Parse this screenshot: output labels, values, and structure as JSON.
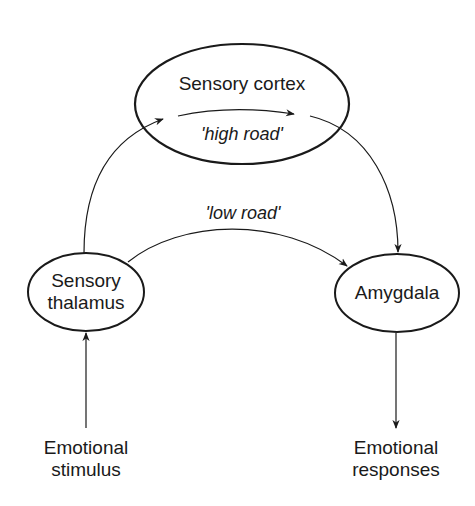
{
  "nodes": {
    "cortex": {
      "label": "Sensory cortex"
    },
    "thalamus": {
      "line1": "Sensory",
      "line2": "thalamus"
    },
    "amygdala": {
      "label": "Amygdala"
    }
  },
  "paths": {
    "high_road": "'high road'",
    "low_road": "'low road'"
  },
  "io": {
    "input": {
      "line1": "Emotional",
      "line2": "stimulus"
    },
    "output": {
      "line1": "Emotional",
      "line2": "responses"
    }
  },
  "colors": {
    "stroke": "#1a1a1a",
    "background": "#ffffff"
  }
}
